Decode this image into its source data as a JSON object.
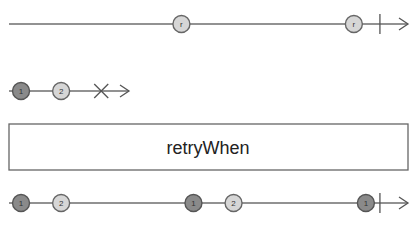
{
  "diagram": {
    "type": "marble-diagram",
    "operator": {
      "label": "retryWhen"
    },
    "notifier_stream": {
      "events": [
        {
          "kind": "item",
          "label": "r",
          "shade": "light",
          "t": 0.43
        },
        {
          "kind": "item",
          "label": "r",
          "shade": "light",
          "t": 0.86
        },
        {
          "kind": "complete",
          "t": 0.925
        }
      ]
    },
    "source_stream": {
      "events": [
        {
          "kind": "item",
          "label": "1",
          "shade": "dark",
          "t": 0.03
        },
        {
          "kind": "item",
          "label": "2",
          "shade": "light",
          "t": 0.13
        },
        {
          "kind": "error",
          "t": 0.23
        }
      ]
    },
    "output_stream": {
      "events": [
        {
          "kind": "item",
          "label": "1",
          "shade": "dark",
          "t": 0.03
        },
        {
          "kind": "item",
          "label": "2",
          "shade": "light",
          "t": 0.13
        },
        {
          "kind": "item",
          "label": "1",
          "shade": "dark",
          "t": 0.46
        },
        {
          "kind": "item",
          "label": "2",
          "shade": "light",
          "t": 0.56
        },
        {
          "kind": "item",
          "label": "1",
          "shade": "dark",
          "t": 0.89
        },
        {
          "kind": "complete",
          "t": 0.925
        }
      ]
    },
    "colors": {
      "dark_marble": "#8a8a8a",
      "light_marble": "#d6d6d6",
      "line": "#6e6e6e"
    }
  }
}
